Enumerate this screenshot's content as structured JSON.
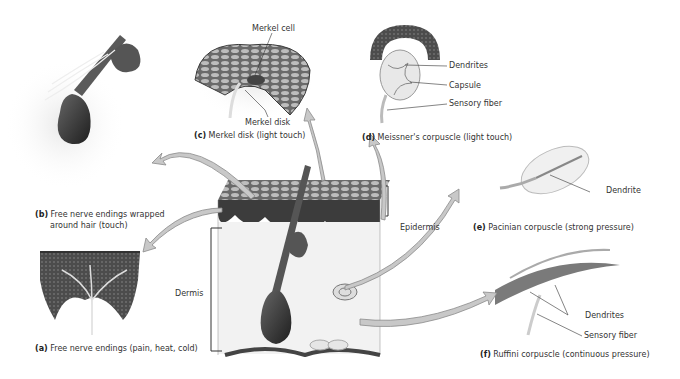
{
  "figure": {
    "panels": [
      {
        "id": "a",
        "letter": "(a)",
        "caption": "Free nerve endings (pain, heat, cold)",
        "labels": []
      },
      {
        "id": "b",
        "letter": "(b)",
        "caption_line1": "Free nerve endings wrapped",
        "caption_line2": "around hair (touch)",
        "labels": []
      },
      {
        "id": "c",
        "letter": "(c)",
        "caption": "Merkel disk (light touch)",
        "labels": [
          "Merkel cell",
          "Merkel disk"
        ]
      },
      {
        "id": "d",
        "letter": "(d)",
        "caption": "Meissner's corpuscle (light touch)",
        "labels": [
          "Dendrites",
          "Capsule",
          "Sensory fiber"
        ]
      },
      {
        "id": "e",
        "letter": "(e)",
        "caption": "Pacinian corpuscle (strong pressure)",
        "labels": [
          "Dendrite"
        ]
      },
      {
        "id": "f",
        "letter": "(f)",
        "caption": "Ruffini corpuscle (continuous pressure)",
        "labels": [
          "Dendrites",
          "Sensory fiber"
        ]
      }
    ],
    "skin_block": {
      "labels": {
        "epidermis": "Epidermis",
        "dermis": "Dermis"
      }
    },
    "colors": {
      "arrow": "#c8c8c8",
      "arrow_stroke": "#8a8a8a",
      "epidermis": "#4a4a4a",
      "dermis": "#f2f2f2",
      "hair_bulb": "#3a3a3a",
      "text": "#333333"
    }
  }
}
